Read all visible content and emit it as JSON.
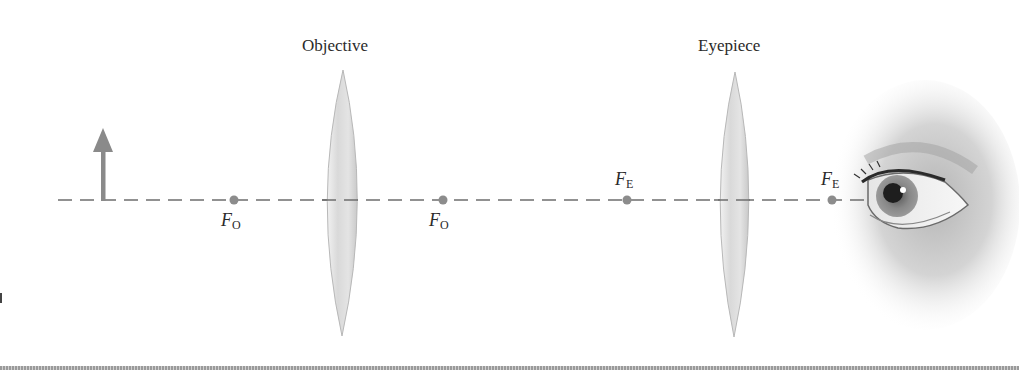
{
  "diagram": {
    "labels": {
      "objective": "Objective",
      "eyepiece": "Eyepiece"
    },
    "focal_points": [
      {
        "id": "fo-left",
        "symbol": "F",
        "subscript": "O",
        "x": 234,
        "label_pos": "below"
      },
      {
        "id": "fo-right",
        "symbol": "F",
        "subscript": "O",
        "x": 443,
        "label_pos": "below"
      },
      {
        "id": "fe-left",
        "symbol": "F",
        "subscript": "E",
        "x": 627,
        "label_pos": "above"
      },
      {
        "id": "fe-right",
        "symbol": "F",
        "subscript": "E",
        "x": 832,
        "label_pos": "above"
      }
    ],
    "axis_y": 200,
    "object_arrow": {
      "x": 103,
      "top": 132
    },
    "colors": {
      "axis": "#6e6e6e",
      "arrow": "#8a8a8a",
      "dot": "#8c8c8c",
      "lens": "#d6d6d6"
    }
  }
}
